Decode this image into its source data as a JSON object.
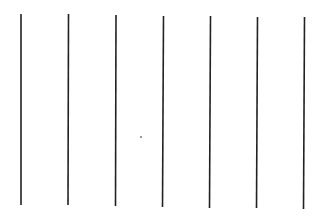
{
  "figure": {
    "background": "#ffffff",
    "stroke_color": "#222222",
    "lines": [
      {
        "x1": 21,
        "y1": 14,
        "x2": 21,
        "y2": 205
      },
      {
        "x1": 68.5,
        "y1": 14,
        "x2": 68,
        "y2": 205
      },
      {
        "x1": 116,
        "y1": 15,
        "x2": 115.5,
        "y2": 206
      },
      {
        "x1": 163.5,
        "y1": 16,
        "x2": 162.5,
        "y2": 207
      },
      {
        "x1": 210.5,
        "y1": 16,
        "x2": 209.5,
        "y2": 208
      },
      {
        "x1": 257.5,
        "y1": 17,
        "x2": 256.5,
        "y2": 208
      },
      {
        "x1": 304.5,
        "y1": 17,
        "x2": 303.5,
        "y2": 209
      }
    ],
    "dot": {
      "cx": 141,
      "cy": 137,
      "r": 1
    }
  }
}
